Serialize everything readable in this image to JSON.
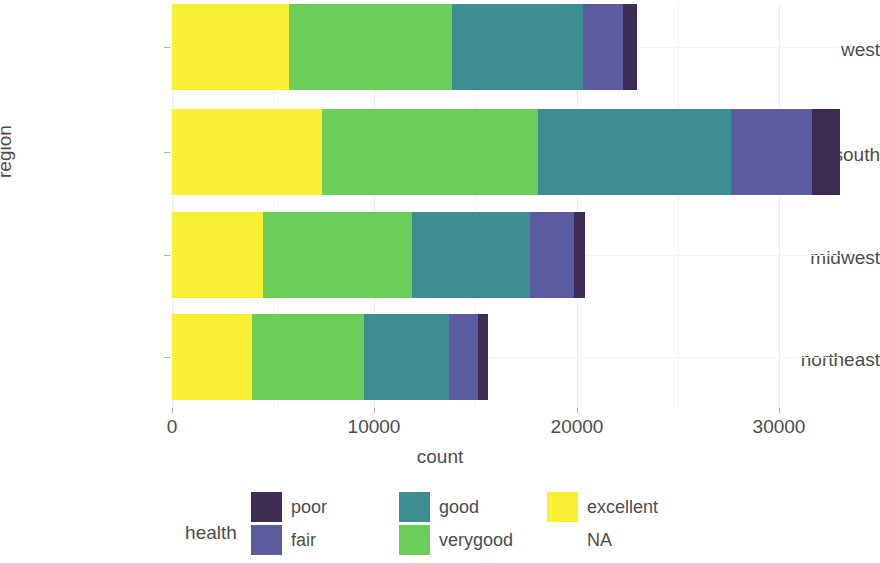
{
  "chart_data": {
    "type": "bar",
    "orientation": "horizontal",
    "stacked": true,
    "title": "",
    "xlabel": "count",
    "ylabel": "region",
    "categories": [
      "northeast",
      "midwest",
      "south",
      "west"
    ],
    "categories_display_order": [
      "west",
      "south",
      "midwest",
      "northeast"
    ],
    "xlim": [
      0,
      33000
    ],
    "xticks": [
      0,
      10000,
      20000,
      30000
    ],
    "xtick_labels": [
      "0",
      "10000",
      "20000",
      "30000"
    ],
    "grid": true,
    "legend": {
      "title": "health",
      "position": "bottom",
      "entries": [
        {
          "label": "poor",
          "color": "#3E2C52"
        },
        {
          "label": "fair",
          "color": "#5B5BA0"
        },
        {
          "label": "good",
          "color": "#3C8E92"
        },
        {
          "label": "verygood",
          "color": "#6DCD59"
        },
        {
          "label": "excellent",
          "color": "#F7F033"
        },
        {
          "label": "NA",
          "color": "#FFFFFF"
        }
      ]
    },
    "series": [
      {
        "name": "excellent",
        "color": "#F7F033",
        "values": {
          "west": 5800,
          "south": 7400,
          "midwest": 4500,
          "northeast": 3950
        }
      },
      {
        "name": "verygood",
        "color": "#6DCD59",
        "values": {
          "west": 8050,
          "south": 10700,
          "midwest": 7350,
          "northeast": 5550
        }
      },
      {
        "name": "good",
        "color": "#3C8E92",
        "values": {
          "west": 6450,
          "south": 9550,
          "midwest": 5850,
          "northeast": 4200
        }
      },
      {
        "name": "fair",
        "color": "#5B5BA0",
        "values": {
          "west": 2000,
          "south": 4000,
          "midwest": 2150,
          "northeast": 1450
        }
      },
      {
        "name": "poor",
        "color": "#3E2C52",
        "values": {
          "west": 700,
          "south": 1350,
          "midwest": 550,
          "northeast": 450
        }
      }
    ],
    "totals": {
      "west": 23000,
      "south": 33000,
      "midwest": 20400,
      "northeast": 15600
    }
  }
}
